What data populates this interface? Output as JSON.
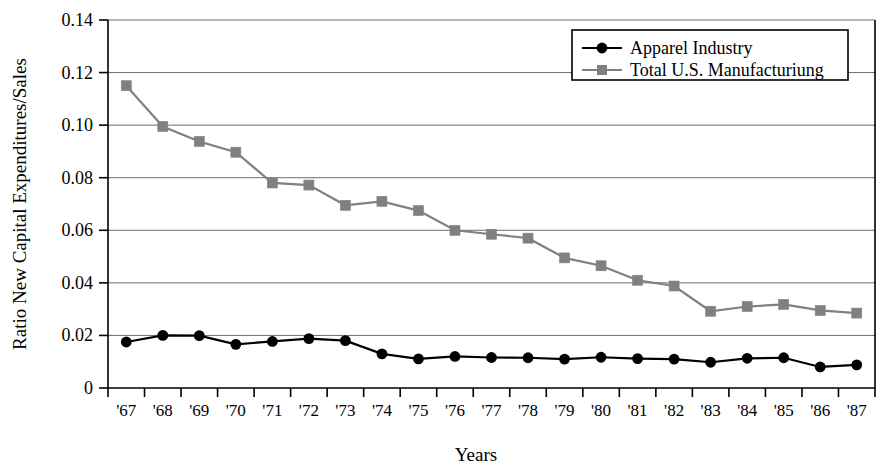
{
  "chart_data": {
    "type": "line",
    "title": "",
    "xlabel": "Years",
    "ylabel": "Ratio New Capital Expenditures/Sales",
    "categories": [
      "'67",
      "'68",
      "'69",
      "'70",
      "'71",
      "'72",
      "'73",
      "'74",
      "'75",
      "'76",
      "'77",
      "'78",
      "'79",
      "'80",
      "'81",
      "'82",
      "'83",
      "'84",
      "'85",
      "'86",
      "'87"
    ],
    "ylim": [
      0,
      0.14
    ],
    "yticks": [
      0,
      0.02,
      0.04,
      0.06,
      0.08,
      0.1,
      0.12,
      0.14
    ],
    "ytick_labels": [
      "0",
      "0.02",
      "0.04",
      "0.06",
      "0.08",
      "0.10",
      "0.12",
      "0.14"
    ],
    "grid": true,
    "grid_axis": "y",
    "legend_position": "top-right",
    "series": [
      {
        "name": "Apparel Industry",
        "marker": "circle",
        "color": "#000000",
        "values": [
          0.0175,
          0.02,
          0.0199,
          0.0166,
          0.0177,
          0.0188,
          0.018,
          0.013,
          0.0111,
          0.012,
          0.0116,
          0.0115,
          0.011,
          0.0117,
          0.0112,
          0.011,
          0.0098,
          0.0113,
          0.0115,
          0.008,
          0.0088
        ]
      },
      {
        "name": "Total U.S. Manufacturiung",
        "marker": "square",
        "color": "#808080",
        "values": [
          0.115,
          0.0995,
          0.0938,
          0.0897,
          0.078,
          0.0772,
          0.0695,
          0.071,
          0.0675,
          0.06,
          0.0585,
          0.057,
          0.0495,
          0.0465,
          0.041,
          0.0388,
          0.0292,
          0.031,
          0.0318,
          0.0295,
          0.0285
        ]
      }
    ]
  },
  "axes": {
    "ylabel": "Ratio New Capital Expenditures/Sales",
    "xlabel": "Years"
  },
  "legend": {
    "entries": [
      {
        "label": "Apparel Industry",
        "marker": "circle-marker",
        "color": "#000000"
      },
      {
        "label": "Total U.S. Manufacturiung",
        "marker": "square-marker",
        "color": "#808080"
      }
    ]
  },
  "colors": {
    "apparel": "#000000",
    "manufacturing": "#808080",
    "grid": "#6e6e6e",
    "axis": "#000000",
    "background": "#ffffff"
  }
}
